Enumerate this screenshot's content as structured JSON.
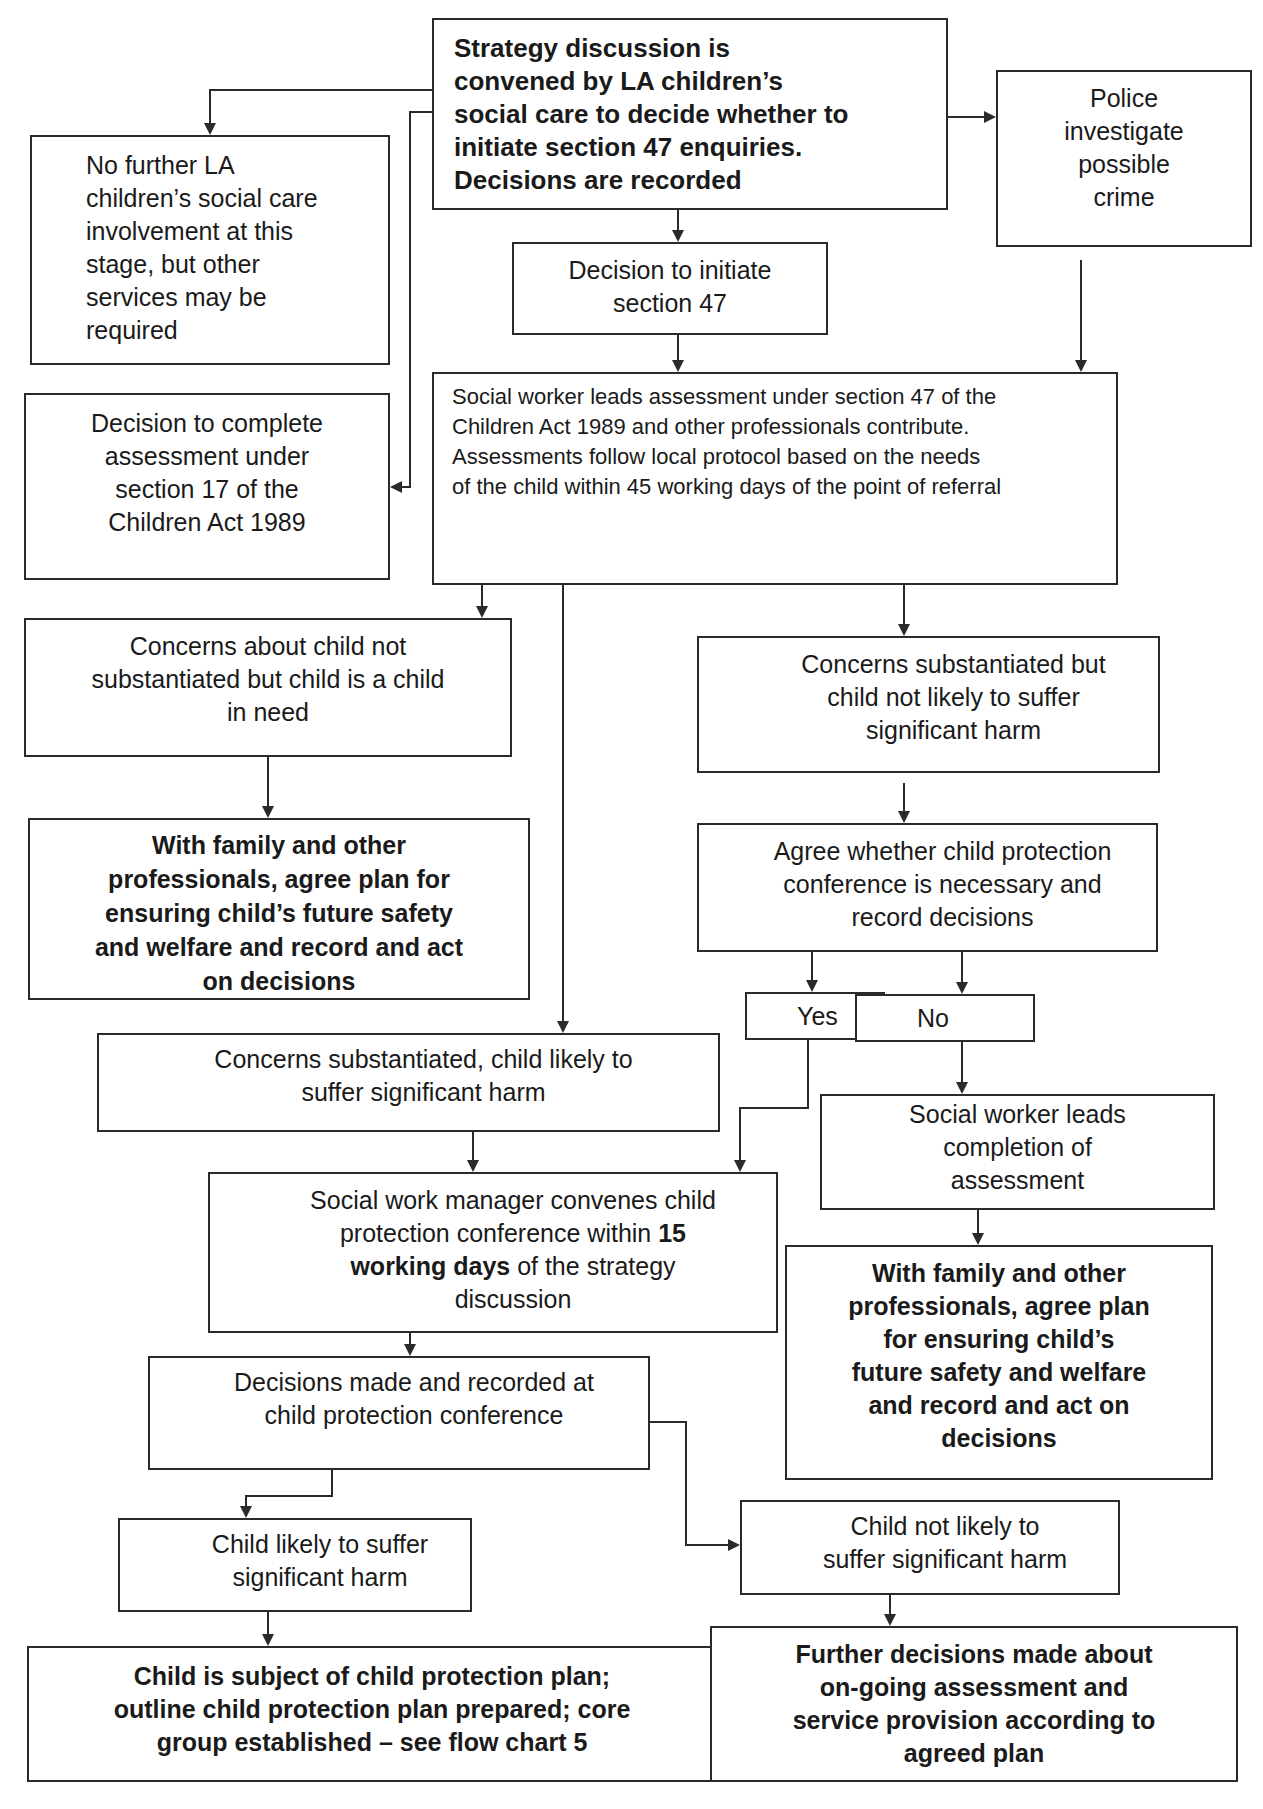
{
  "diagram": {
    "nodes": {
      "strategy": "Strategy discussion is\nconvened by LA children’s\nsocial care to decide whether to\ninitiate section 47 enquiries.\nDecisions are recorded",
      "police": "Police\ninvestigate\npossible\ncrime",
      "no_further": "No further LA\nchildren’s social care\ninvolvement at this\nstage, but other\nservices may be\nrequired",
      "decision_initiate": "Decision to initiate\nsection 47",
      "sw_assessment": "Social worker leads assessment under section 47 of the\nChildren Act 1989 and other professionals contribute.\nAssessments follow local protocol based on the needs\nof the child within 45 working days of the point of referral",
      "decision_s17": "Decision to complete\nassessment under\nsection 17 of the\nChildren Act 1989",
      "not_substantiated": "Concerns about child not\nsubstantiated but child is a child\nin need",
      "subst_not_likely": "Concerns substantiated but\nchild not likely to suffer\nsignificant harm",
      "family_plan_left": "With family and other\nprofessionals, agree plan for\nensuring child’s future safety\nand welfare and record and act\non decisions",
      "agree_conference": "Agree whether child protection\nconference is necessary and\nrecord decisions",
      "yes": "Yes",
      "no": "No",
      "subst_likely": "Concerns substantiated, child likely to\nsuffer significant harm",
      "sw_completion": "Social worker leads\ncompletion of\nassessment",
      "manager_conference_pre": "Social work manager convenes child\nprotection conference within ",
      "manager_conference_bold": "15\nworking days",
      "manager_conference_post": " of the strategy\ndiscussion",
      "family_plan_right": "With family and other\nprofessionals, agree plan\nfor ensuring child’s\nfuture safety and welfare\nand record and act on\ndecisions",
      "decisions_made": "Decisions made and recorded at\nchild protection conference",
      "child_likely": "Child likely to suffer\nsignificant harm",
      "child_not_likely": "Child not likely to\nsuffer significant harm",
      "cp_plan": "Child is subject of child protection plan;\noutline child protection plan prepared; core\ngroup established – see flow chart 5",
      "further_decisions": "Further decisions made about\non-going assessment and\nservice provision according to\nagreed plan"
    },
    "colors": {
      "line": "#2a2a2a",
      "background": "#ffffff",
      "text": "#1a1a1a"
    }
  }
}
